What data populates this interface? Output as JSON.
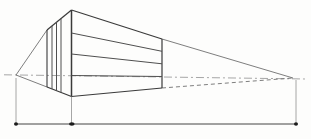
{
  "figure": {
    "canvas": {
      "width": 311,
      "height": 139
    },
    "colors": {
      "background": "#fdfdfc",
      "edge": "#3a3a3a",
      "division": "#4f4f4f",
      "construction": "#6f6f6f",
      "horizon": "#9c9c9c",
      "dimension": "#454545",
      "extension": "#8f8f8f",
      "dot": "#1c1c1c"
    },
    "points": {
      "left_vanishing_point": {
        "x": 16,
        "y": 75
      },
      "right_vanishing_point": {
        "x": 293,
        "y": 78
      }
    },
    "lines": [
      {
        "id": "horizon-line",
        "x1": 4,
        "y1": 74.8,
        "x2": 306,
        "y2": 79,
        "stroke": "horizon",
        "width": 0.9,
        "dash": "8 3 2 3"
      },
      {
        "id": "left-top-construction-line",
        "x1": 47,
        "y1": 30,
        "x2": 16,
        "y2": 75,
        "stroke": "construction",
        "width": 0.9
      },
      {
        "id": "left-bottom-construction-line",
        "x1": 47,
        "y1": 87,
        "x2": 16,
        "y2": 75,
        "stroke": "construction",
        "width": 0.9
      },
      {
        "id": "right-top-construction-line",
        "x1": 162,
        "y1": 39,
        "x2": 293,
        "y2": 78,
        "stroke": "construction",
        "width": 0.9
      },
      {
        "id": "right-bottom-construction-line",
        "x1": 162,
        "y1": 88,
        "x2": 293,
        "y2": 78,
        "stroke": "construction",
        "width": 0.9,
        "dash": "4 3"
      },
      {
        "id": "near-vertical-edge",
        "x1": 71.5,
        "y1": 10,
        "x2": 71.5,
        "y2": 96.5,
        "stroke": "edge",
        "width": 1.5
      },
      {
        "id": "top-right-edge",
        "x1": 71.5,
        "y1": 10,
        "x2": 162,
        "y2": 39,
        "stroke": "edge",
        "width": 1.2
      },
      {
        "id": "bottom-right-edge",
        "x1": 71.5,
        "y1": 96.5,
        "x2": 162,
        "y2": 88,
        "stroke": "edge",
        "width": 1.2
      },
      {
        "id": "far-right-edge",
        "x1": 162,
        "y1": 39,
        "x2": 162,
        "y2": 88,
        "stroke": "edge",
        "width": 1.2
      },
      {
        "id": "top-left-edge",
        "x1": 71.5,
        "y1": 10,
        "x2": 47,
        "y2": 30,
        "stroke": "edge",
        "width": 1.2
      },
      {
        "id": "bottom-left-edge",
        "x1": 71.5,
        "y1": 96.5,
        "x2": 47,
        "y2": 87,
        "stroke": "edge",
        "width": 1.2
      },
      {
        "id": "far-left-edge",
        "x1": 47,
        "y1": 30,
        "x2": 47,
        "y2": 87,
        "stroke": "edge",
        "width": 1.1
      },
      {
        "id": "left-face-division-1",
        "x1": 61,
        "y1": 18.5,
        "x2": 61,
        "y2": 92.5,
        "stroke": "division",
        "width": 1
      },
      {
        "id": "left-face-division-2",
        "x1": 56.5,
        "y1": 22.2,
        "x2": 56.5,
        "y2": 90.8,
        "stroke": "division",
        "width": 1
      },
      {
        "id": "left-face-division-3",
        "x1": 52,
        "y1": 25.9,
        "x2": 52,
        "y2": 89.1,
        "stroke": "division",
        "width": 1
      },
      {
        "id": "right-face-division-1",
        "x1": 71.5,
        "y1": 33,
        "x2": 162,
        "y2": 51.3,
        "stroke": "division",
        "width": 1
      },
      {
        "id": "right-face-division-2",
        "x1": 71.5,
        "y1": 54,
        "x2": 162,
        "y2": 63.8,
        "stroke": "division",
        "width": 1
      },
      {
        "id": "right-face-division-3",
        "x1": 71.5,
        "y1": 75.5,
        "x2": 162,
        "y2": 76.5,
        "stroke": "division",
        "width": 1
      },
      {
        "id": "measuring-line",
        "x1": 16,
        "y1": 124,
        "x2": 296,
        "y2": 124,
        "stroke": "dimension",
        "width": 1
      },
      {
        "id": "left-extension-line",
        "x1": 16,
        "y1": 78,
        "x2": 16,
        "y2": 124,
        "stroke": "extension",
        "width": 0.8
      },
      {
        "id": "middle-extension-line",
        "x1": 71.5,
        "y1": 97,
        "x2": 71.5,
        "y2": 124,
        "stroke": "extension",
        "width": 0.8
      },
      {
        "id": "right-extension-line",
        "x1": 296,
        "y1": 80,
        "x2": 296,
        "y2": 124,
        "stroke": "extension",
        "width": 0.8
      }
    ],
    "dots": [
      {
        "id": "left-tick-dot",
        "x": 16,
        "y": 124,
        "rx": 2.0,
        "ry": 1.8
      },
      {
        "id": "middle-tick-dot",
        "x": 71.8,
        "y": 124,
        "rx": 2.8,
        "ry": 1.8
      },
      {
        "id": "right-tick-dot",
        "x": 296,
        "y": 124,
        "rx": 2.0,
        "ry": 1.8
      }
    ]
  }
}
